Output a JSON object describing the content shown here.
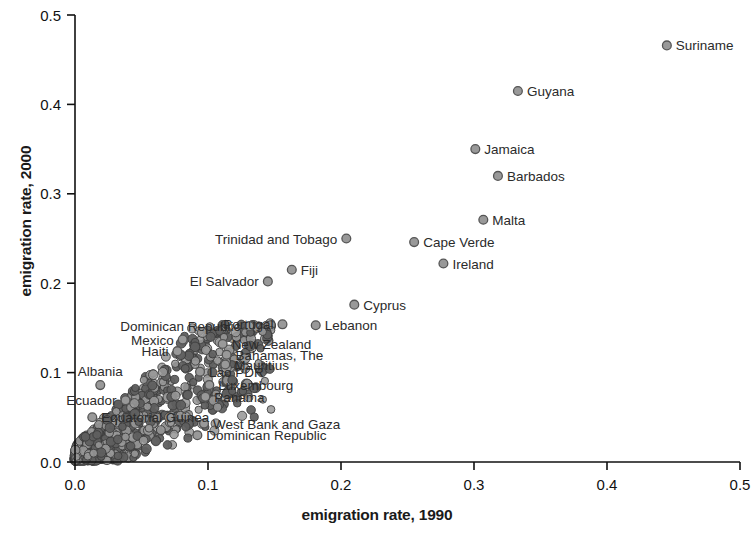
{
  "chart_data": {
    "type": "scatter",
    "title": "",
    "xlabel": "emigration rate, 1990",
    "ylabel": "emigration rate, 2000",
    "xlim": [
      0.0,
      0.5
    ],
    "ylim": [
      0.0,
      0.5
    ],
    "xticks": [
      "0.0",
      "0.1",
      "0.2",
      "0.3",
      "0.4",
      "0.5"
    ],
    "yticks": [
      "0.0",
      "0.1",
      "0.2",
      "0.3",
      "0.4",
      "0.5"
    ],
    "xtick_values": [
      0.0,
      0.1,
      0.2,
      0.3,
      0.4,
      0.5
    ],
    "ytick_values": [
      0.0,
      0.1,
      0.2,
      0.3,
      0.4,
      0.5
    ],
    "grid": false,
    "legend": "none",
    "marker_fill": "#999999",
    "marker_edge": "#555555",
    "marker_radius": 4.4,
    "labeled_points": [
      {
        "label": "Suriname",
        "x": 0.445,
        "y": 0.466,
        "label_pos": "right"
      },
      {
        "label": "Guyana",
        "x": 0.333,
        "y": 0.415,
        "label_pos": "right"
      },
      {
        "label": "Jamaica",
        "x": 0.301,
        "y": 0.35,
        "label_pos": "right"
      },
      {
        "label": "Barbados",
        "x": 0.318,
        "y": 0.32,
        "label_pos": "right"
      },
      {
        "label": "Malta",
        "x": 0.307,
        "y": 0.271,
        "label_pos": "right"
      },
      {
        "label": "Cape Verde",
        "x": 0.255,
        "y": 0.246,
        "label_pos": "right"
      },
      {
        "label": "Ireland",
        "x": 0.277,
        "y": 0.222,
        "label_pos": "right"
      },
      {
        "label": "Trinidad and Tobago",
        "x": 0.204,
        "y": 0.25,
        "label_pos": "left"
      },
      {
        "label": "Fiji",
        "x": 0.163,
        "y": 0.215,
        "label_pos": "right"
      },
      {
        "label": "El Salvador",
        "x": 0.145,
        "y": 0.202,
        "label_pos": "left"
      },
      {
        "label": "Cyprus",
        "x": 0.21,
        "y": 0.176,
        "label_pos": "right"
      },
      {
        "label": "Portugal",
        "x": 0.156,
        "y": 0.154,
        "label_pos": "left"
      },
      {
        "label": "Lebanon",
        "x": 0.181,
        "y": 0.153,
        "label_pos": "right"
      },
      {
        "label": "Dominican Republic",
        "x": 0.131,
        "y": 0.152,
        "label_pos": "left"
      },
      {
        "label": "New Zealand",
        "x": 0.111,
        "y": 0.132,
        "label_pos": "right"
      },
      {
        "label": "Bahamas, The",
        "x": 0.114,
        "y": 0.12,
        "label_pos": "right"
      },
      {
        "label": "Mauritius",
        "x": 0.113,
        "y": 0.109,
        "label_pos": "right"
      },
      {
        "label": "Mexico",
        "x": 0.081,
        "y": 0.137,
        "label_pos": "left"
      },
      {
        "label": "Haiti",
        "x": 0.077,
        "y": 0.124,
        "label_pos": "left"
      },
      {
        "label": "Albania",
        "x": 0.019,
        "y": 0.086,
        "label_pos": "above"
      },
      {
        "label": "Ecuador",
        "x": 0.038,
        "y": 0.069,
        "label_pos": "left"
      },
      {
        "label": "Equatorial Guinea",
        "x": 0.013,
        "y": 0.05,
        "label_pos": "right"
      },
      {
        "label": "Lao PDR",
        "x": 0.094,
        "y": 0.101,
        "label_pos": "right"
      },
      {
        "label": "Luxembourg",
        "x": 0.101,
        "y": 0.086,
        "label_pos": "right"
      },
      {
        "label": "Panama",
        "x": 0.098,
        "y": 0.073,
        "label_pos": "right"
      },
      {
        "label": "West Bank and Gaza",
        "x": 0.097,
        "y": 0.043,
        "label_pos": "right"
      },
      {
        "label": "Dominican Republic",
        "x": 0.092,
        "y": 0.03,
        "label_pos": "right"
      }
    ]
  },
  "figure": {
    "axis_color": "#111111",
    "background": "#ffffff"
  }
}
